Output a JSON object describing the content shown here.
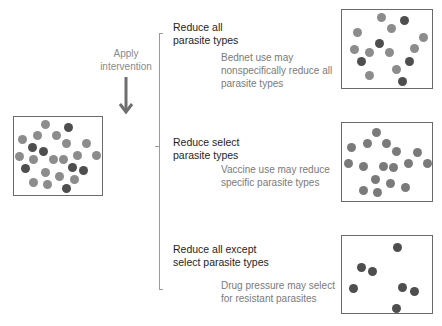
{
  "colors": {
    "mid": "#8c8c8c",
    "dark": "#4e4e4e",
    "border": "#6a6a6a",
    "arrow": "#6e6e6e"
  },
  "intervention": {
    "label_line1": "Apply",
    "label_line2": "intervention",
    "arrow_icon": "down-arrow"
  },
  "initial_population": {
    "dots": [
      {
        "x": 45,
        "y": 124,
        "t": "mid"
      },
      {
        "x": 68,
        "y": 127,
        "t": "dark"
      },
      {
        "x": 22,
        "y": 139,
        "t": "mid"
      },
      {
        "x": 37,
        "y": 135,
        "t": "mid"
      },
      {
        "x": 56,
        "y": 135,
        "t": "mid"
      },
      {
        "x": 32,
        "y": 147,
        "t": "dark"
      },
      {
        "x": 43,
        "y": 151,
        "t": "dark"
      },
      {
        "x": 66,
        "y": 143,
        "t": "mid"
      },
      {
        "x": 86,
        "y": 143,
        "t": "mid"
      },
      {
        "x": 19,
        "y": 156,
        "t": "mid"
      },
      {
        "x": 33,
        "y": 159,
        "t": "mid"
      },
      {
        "x": 53,
        "y": 159,
        "t": "mid"
      },
      {
        "x": 63,
        "y": 159,
        "t": "mid"
      },
      {
        "x": 77,
        "y": 155,
        "t": "mid"
      },
      {
        "x": 96,
        "y": 155,
        "t": "mid"
      },
      {
        "x": 25,
        "y": 168,
        "t": "dark"
      },
      {
        "x": 45,
        "y": 172,
        "t": "mid"
      },
      {
        "x": 72,
        "y": 167,
        "t": "dark"
      },
      {
        "x": 83,
        "y": 170,
        "t": "dark"
      },
      {
        "x": 59,
        "y": 176,
        "t": "mid"
      },
      {
        "x": 74,
        "y": 179,
        "t": "mid"
      },
      {
        "x": 33,
        "y": 182,
        "t": "mid"
      },
      {
        "x": 47,
        "y": 184,
        "t": "mid"
      },
      {
        "x": 66,
        "y": 188,
        "t": "dark"
      }
    ]
  },
  "outcomes": [
    {
      "heading_line1": "Reduce all",
      "heading_line2": "parasite types",
      "desc_line1": "Bednet use may",
      "desc_line2": "nonspecifically reduce all",
      "desc_line3": "parasite types",
      "dots": [
        {
          "x": 381,
          "y": 17,
          "t": "mid"
        },
        {
          "x": 404,
          "y": 20,
          "t": "dark"
        },
        {
          "x": 391,
          "y": 28,
          "t": "mid"
        },
        {
          "x": 357,
          "y": 32,
          "t": "mid"
        },
        {
          "x": 423,
          "y": 37,
          "t": "mid"
        },
        {
          "x": 379,
          "y": 43,
          "t": "dark"
        },
        {
          "x": 354,
          "y": 49,
          "t": "mid"
        },
        {
          "x": 369,
          "y": 52,
          "t": "mid"
        },
        {
          "x": 389,
          "y": 52,
          "t": "mid"
        },
        {
          "x": 414,
          "y": 48,
          "t": "mid"
        },
        {
          "x": 361,
          "y": 61,
          "t": "dark"
        },
        {
          "x": 409,
          "y": 61,
          "t": "dark"
        },
        {
          "x": 369,
          "y": 75,
          "t": "mid"
        },
        {
          "x": 396,
          "y": 69,
          "t": "mid"
        },
        {
          "x": 402,
          "y": 81,
          "t": "dark"
        }
      ]
    },
    {
      "heading_line1": "Reduce select",
      "heading_line2": "parasite types",
      "desc_line1": "Vaccine use may reduce",
      "desc_line2": "specific parasite types",
      "desc_line3": "",
      "dots": [
        {
          "x": 376,
          "y": 132,
          "t": "mixed"
        },
        {
          "x": 351,
          "y": 147,
          "t": "mixed"
        },
        {
          "x": 367,
          "y": 143,
          "t": "mixed"
        },
        {
          "x": 386,
          "y": 143,
          "t": "mixed"
        },
        {
          "x": 396,
          "y": 151,
          "t": "mixed"
        },
        {
          "x": 417,
          "y": 152,
          "t": "mixed"
        },
        {
          "x": 348,
          "y": 163,
          "t": "mixed"
        },
        {
          "x": 363,
          "y": 166,
          "t": "mixed"
        },
        {
          "x": 383,
          "y": 166,
          "t": "mixed"
        },
        {
          "x": 393,
          "y": 167,
          "t": "mixed"
        },
        {
          "x": 408,
          "y": 163,
          "t": "mixed"
        },
        {
          "x": 427,
          "y": 163,
          "t": "mixed"
        },
        {
          "x": 375,
          "y": 179,
          "t": "mixed"
        },
        {
          "x": 390,
          "y": 183,
          "t": "mixed"
        },
        {
          "x": 405,
          "y": 187,
          "t": "mixed"
        },
        {
          "x": 363,
          "y": 190,
          "t": "mixed"
        },
        {
          "x": 377,
          "y": 192,
          "t": "mixed"
        }
      ]
    },
    {
      "heading_line1": "Reduce all except",
      "heading_line2": "select parasite types",
      "desc_line1": "Drug pressure may select",
      "desc_line2": "for resistant parasites",
      "desc_line3": "",
      "dots": [
        {
          "x": 397,
          "y": 247,
          "t": "dark"
        },
        {
          "x": 361,
          "y": 267,
          "t": "dark"
        },
        {
          "x": 372,
          "y": 271,
          "t": "dark"
        },
        {
          "x": 353,
          "y": 288,
          "t": "dark"
        },
        {
          "x": 402,
          "y": 287,
          "t": "dark"
        },
        {
          "x": 414,
          "y": 291,
          "t": "dark"
        },
        {
          "x": 396,
          "y": 308,
          "t": "dark"
        }
      ]
    }
  ]
}
